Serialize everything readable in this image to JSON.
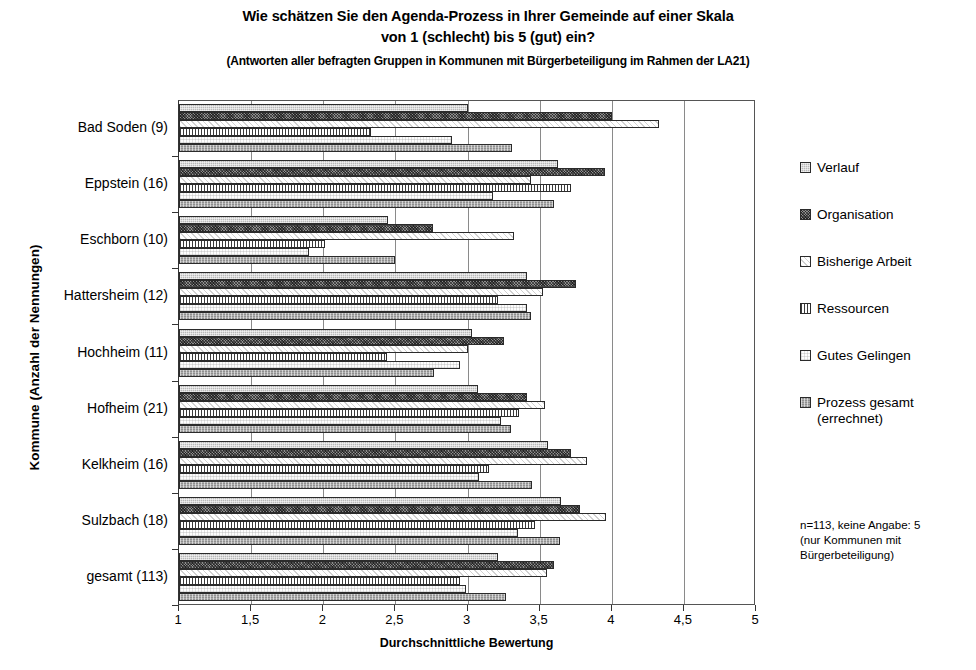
{
  "title": {
    "line1": "Wie schätzen Sie den Agenda-Prozess in Ihrer Gemeinde auf einer Skala",
    "line2": "von 1 (schlecht) bis 5 (gut) ein?",
    "line3": "(Antworten aller befragten Gruppen in Kommunen mit Bürgerbeteiligung im Rahmen der LA21)"
  },
  "legend": {
    "items": [
      {
        "label": "Verlauf",
        "pattern": "light-grey-speckle"
      },
      {
        "label": "Organisation",
        "pattern": "dark-speckle"
      },
      {
        "label": "Bisherige Arbeit",
        "pattern": "white-faint-diagonal"
      },
      {
        "label": "Ressourcen",
        "pattern": "vertical-lines"
      },
      {
        "label": "Gutes Gelingen",
        "pattern": "white-light-dots"
      },
      {
        "label": "Prozess gesamt (errechnet)",
        "pattern": "medium-grey-speckle"
      }
    ],
    "note": [
      "n=113, keine Angabe: 5",
      "(nur Kommunen mit",
      "Bürgerbeteiligung)"
    ]
  },
  "chart_data": {
    "type": "bar",
    "orientation": "horizontal",
    "title": "Wie schätzen Sie den Agenda-Prozess in Ihrer Gemeinde auf einer Skala von 1 (schlecht) bis 5 (gut) ein?",
    "subtitle": "(Antworten aller befragten Gruppen in Kommunen mit Bürgerbeteiligung im Rahmen der LA21)",
    "xlabel": "Durchschnittliche Bewertung",
    "ylabel": "Kommune (Anzahl der Nennungen)",
    "xlim": [
      1,
      5
    ],
    "xticks": [
      1,
      1.5,
      2,
      2.5,
      3,
      3.5,
      4,
      4.5,
      5
    ],
    "xtick_labels": [
      "1",
      "1,5",
      "2",
      "2,5",
      "3",
      "3,5",
      "4",
      "4,5",
      "5"
    ],
    "grid": "vertical",
    "legend_position": "right",
    "categories": [
      "Bad Soden (9)",
      "Eppstein (16)",
      "Eschborn (10)",
      "Hattersheim (12)",
      "Hochheim (11)",
      "Hofheim (21)",
      "Kelkheim (16)",
      "Sulzbach (18)",
      "gesamt (113)"
    ],
    "series": [
      {
        "name": "Verlauf",
        "values": [
          3.0,
          3.63,
          2.45,
          3.41,
          3.03,
          3.07,
          3.56,
          3.65,
          3.21
        ]
      },
      {
        "name": "Organisation",
        "values": [
          4.0,
          3.95,
          2.76,
          3.75,
          3.25,
          3.41,
          3.72,
          3.78,
          3.6
        ]
      },
      {
        "name": "Bisherige Arbeit",
        "values": [
          4.33,
          3.44,
          3.32,
          3.52,
          3.0,
          3.54,
          3.83,
          3.96,
          3.55
        ]
      },
      {
        "name": "Ressourcen",
        "values": [
          2.33,
          3.72,
          2.01,
          3.21,
          2.44,
          3.36,
          3.15,
          3.47,
          2.95
        ]
      },
      {
        "name": "Gutes Gelingen",
        "values": [
          2.89,
          3.18,
          1.9,
          3.41,
          2.95,
          3.23,
          3.08,
          3.35,
          2.99
        ]
      },
      {
        "name": "Prozess gesamt (errechnet)",
        "values": [
          3.31,
          3.6,
          2.5,
          3.44,
          2.77,
          3.3,
          3.45,
          3.64,
          3.27
        ]
      }
    ]
  }
}
